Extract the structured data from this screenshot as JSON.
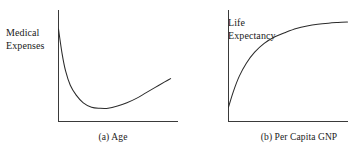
{
  "figure": {
    "background_color": "#ffffff",
    "stroke_color": "#2b2b2b",
    "text_color": "#1a1a1a"
  },
  "chart_data": [
    {
      "id": "panel-a",
      "type": "line",
      "title": "",
      "caption": "(a) Age",
      "caption_index": "(a)",
      "caption_text": "Age",
      "ylabel": "Medical Expenses",
      "ylabel_line1": "Medical",
      "ylabel_line2": "Expenses",
      "xlabel": "Age",
      "grid": false,
      "legend": false,
      "axis_ticks": false,
      "axis_tick_labels": [],
      "xlim": [
        0,
        1
      ],
      "ylim": [
        0,
        1
      ],
      "shape": "u-shaped convex curve: high at young age, falling to a minimum in middle age, then rising again in old age",
      "series": [
        {
          "name": "Medical Expenses vs Age",
          "x": [
            0.0,
            0.03,
            0.06,
            0.1,
            0.15,
            0.21,
            0.28,
            0.35,
            0.42,
            0.5,
            0.58,
            0.66,
            0.74,
            0.82,
            0.9,
            0.95
          ],
          "y": [
            0.84,
            0.62,
            0.46,
            0.33,
            0.24,
            0.17,
            0.13,
            0.12,
            0.12,
            0.14,
            0.17,
            0.21,
            0.26,
            0.31,
            0.36,
            0.39
          ]
        }
      ]
    },
    {
      "id": "panel-b",
      "type": "line",
      "title": "",
      "caption": "(b) Per Capita GNP",
      "caption_index": "(b)",
      "caption_text": "Per Capita GNP",
      "ylabel": "Life Expectancy",
      "ylabel_line1": "Life",
      "ylabel_line2": "Expectancy",
      "xlabel": "Per Capita GNP",
      "grid": false,
      "legend": false,
      "axis_ticks": false,
      "axis_tick_labels": [],
      "xlim": [
        0,
        1
      ],
      "ylim": [
        0,
        1
      ],
      "shape": "concave increasing curve with diminishing returns, rising steeply at low GNP then flattening to a plateau",
      "series": [
        {
          "name": "Life Expectancy vs Per Capita GNP",
          "x": [
            0.0,
            0.04,
            0.09,
            0.15,
            0.22,
            0.3,
            0.39,
            0.48,
            0.57,
            0.66,
            0.75,
            0.84,
            0.92,
            1.0
          ],
          "y": [
            0.13,
            0.27,
            0.41,
            0.53,
            0.63,
            0.71,
            0.77,
            0.81,
            0.845,
            0.868,
            0.884,
            0.894,
            0.9,
            0.905
          ]
        }
      ]
    }
  ]
}
